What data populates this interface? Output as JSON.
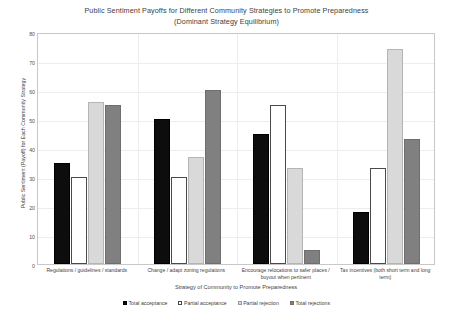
{
  "chart_data": {
    "type": "bar",
    "title": "Public Sentiment Payoffs for Different Community Strategies to Promote Preparedness",
    "subtitle": "(Dominant Strategy Equilibrium)",
    "xlabel": "Strategy of Community to Promote Preparedness",
    "ylabel": "Public Sentiment (Payoff) for Each Community Strategy",
    "ylim": [
      0,
      80
    ],
    "yticks": [
      0,
      10,
      20,
      30,
      40,
      50,
      60,
      70,
      80
    ],
    "grid": true,
    "legend_position": "bottom",
    "categories": [
      "Regulations / guidelines / standards",
      "Change / adapt zoning regulations",
      "Encourage relocations to safer places / buyout when pertinent",
      "Tax incentives (both short term and long term)"
    ],
    "category_lines": [
      [
        "Regulations / guidelines / standards"
      ],
      [
        "Change / adapt zoning regulations"
      ],
      [
        "Encourage relocations to safer places /",
        "buyout when pertinent"
      ],
      [
        "Tax incentives (both short term and long",
        "term)"
      ]
    ],
    "series": [
      {
        "name": "Total acceptance",
        "color": "#0d0d0d",
        "values": [
          35,
          50,
          45,
          18
        ]
      },
      {
        "name": "Partial acceptance",
        "color": "#ffffff",
        "values": [
          30,
          30,
          55,
          33
        ]
      },
      {
        "name": "Partial rejection",
        "color": "#d9d9d9",
        "values": [
          56,
          37,
          33,
          74
        ]
      },
      {
        "name": "Total rejections",
        "color": "#808080",
        "values": [
          55,
          60,
          5,
          43
        ]
      }
    ]
  }
}
